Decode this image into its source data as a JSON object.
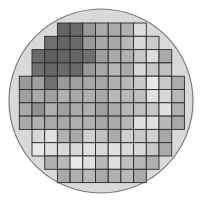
{
  "wafer": {
    "outline_color": "#7a7a7a",
    "fill_color": "#d9d9d9",
    "grid_line_color": "#2a2a2a",
    "center": [
      101,
      101
    ],
    "radius": 92,
    "grid_origin": [
      19.3,
      23
    ],
    "cell_size": [
      12.7,
      13.3
    ],
    "rows": [
      {
        "start_col": 3,
        "cells": [
          "#666666",
          "#6a6a6a",
          "#999999",
          "#aaaaaa",
          "#aaaaaa",
          "#b0b0b0",
          "#dddddd"
        ]
      },
      {
        "start_col": 2,
        "cells": [
          "#707070",
          "#666666",
          "#6a6a6a",
          "#999999",
          "#a8a8a8",
          "#a8a8a8",
          "#b8b8b8",
          "#d8d8d8",
          "#cccccc"
        ]
      },
      {
        "start_col": 1,
        "cells": [
          "#6a6a6a",
          "#606060",
          "#646464",
          "#666666",
          "#707070",
          "#a0a0a0",
          "#aaaaaa",
          "#b0b0b0",
          "#c8c8c8",
          "#dddddd",
          "#aaaaaa"
        ]
      },
      {
        "start_col": 1,
        "cells": [
          "#707070",
          "#666666",
          "#6a6a6a",
          "#6a6a6a",
          "#999999",
          "#a8a8a8",
          "#b8b8b8",
          "#aaaaaa",
          "#d8d8d8",
          "#c8c8c8",
          "#c0c0c0"
        ]
      },
      {
        "start_col": 0,
        "cells": [
          "#9a9a9a",
          "#a0a0a0",
          "#707070",
          "#9a9a9a",
          "#a0a0a0",
          "#a8a8a8",
          "#a8a8a8",
          "#b0b0b0",
          "#b8b8b8",
          "#c8c8c8",
          "#e8e8e8",
          "#c8c8c8",
          "#aaaaaa"
        ]
      },
      {
        "start_col": 0,
        "cells": [
          "#a0a0a0",
          "#aaaaaa",
          "#a0a0a0",
          "#b0b0b0",
          "#a8a8a8",
          "#b0b0b0",
          "#a8a8a8",
          "#b8b8b8",
          "#b8b8b8",
          "#c0c0c0",
          "#e0e0e0",
          "#d8d8d8",
          "#b8b8b8"
        ]
      },
      {
        "start_col": 0,
        "cells": [
          "#aaaaaa",
          "#909090",
          "#b0b0b0",
          "#a0a0a0",
          "#aaaaaa",
          "#b0b0b0",
          "#a0a0a0",
          "#aaaaaa",
          "#b8b8b8",
          "#c0c0c0",
          "#c8c8c8",
          "#e0e0e0",
          "#b0b0b0"
        ]
      },
      {
        "start_col": 0,
        "cells": [
          "#aaaaaa",
          "#b0b0b0",
          "#aaaaaa",
          "#a8a8a8",
          "#b0b0b0",
          "#b0b0b0",
          "#a8a8a8",
          "#aaaaaa",
          "#b8b8b8",
          "#e0e0e0",
          "#e0e0e0",
          "#b8b8b8",
          "#a8a8a8"
        ]
      },
      {
        "start_col": 1,
        "cells": [
          "#d8d8d8",
          "#e0e0e0",
          "#b0b0b0",
          "#a8a8a8",
          "#d0d0d0",
          "#c0c0c0",
          "#aaaaaa",
          "#d0d0d0",
          "#c8c8c8",
          "#d0d0d0",
          "#a8a8a8"
        ]
      },
      {
        "start_col": 1,
        "cells": [
          "#e8e8e8",
          "#e0e0e0",
          "#d8d8d8",
          "#d8d8d8",
          "#e0e0e0",
          "#d8d8d8",
          "#e0e0e0",
          "#d8d8d8",
          "#d8d8d8",
          "#c8c8c8",
          "#aaaaaa"
        ]
      },
      {
        "start_col": 2,
        "cells": [
          "#b0b0b0",
          "#b8b8b8",
          "#e8e8e8",
          "#e0e0e0",
          "#b8b8b8",
          "#e0e0e0",
          "#c0c0c0",
          "#b8b8b8",
          "#b0b0b0"
        ]
      },
      {
        "start_col": 3,
        "cells": [
          "#a8a8a8",
          "#b0b0b0",
          "#b8b8b8",
          "#aaaaaa",
          "#b0b0b0",
          "#b8b8b8",
          "#aaaaaa"
        ]
      }
    ]
  }
}
